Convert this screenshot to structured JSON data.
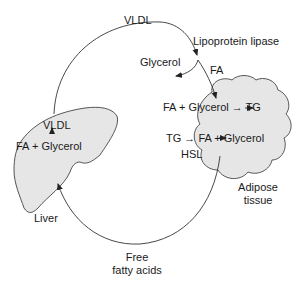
{
  "diagram": {
    "type": "metabolic-cycle",
    "colors": {
      "organ_fill": "#e6e6e6",
      "stroke": "#333333",
      "background": "#ffffff"
    },
    "top_arc": {
      "label": "VLDL"
    },
    "enzyme": {
      "label": "Lipoprotein lipase"
    },
    "branch_glycerol": {
      "label": "Glycerol"
    },
    "branch_fa": {
      "label": "FA"
    },
    "liver": {
      "name": "Liver",
      "product": "VLDL",
      "reactants": "FA + Glycerol"
    },
    "adipose": {
      "name_line1": "Adipose",
      "name_line2": "tissue",
      "synthesis": "FA + Glycerol → TG",
      "lipolysis": "TG → FA + Glycerol",
      "enzyme": "HSL"
    },
    "bottom_arc": {
      "label_line1": "Free",
      "label_line2": "fatty acids"
    }
  }
}
